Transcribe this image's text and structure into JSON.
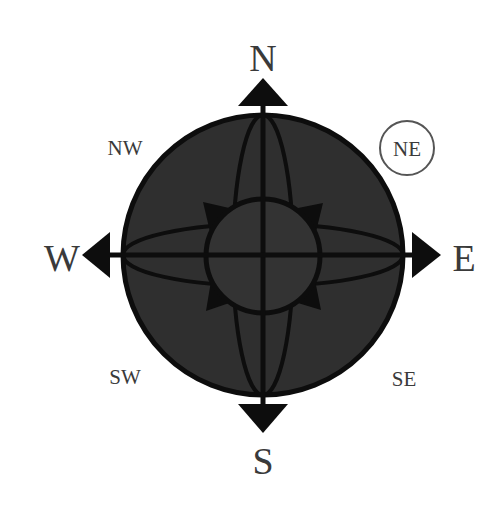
{
  "diagram": {
    "cardinals": {
      "north": "N",
      "east": "E",
      "south": "S",
      "west": "W"
    },
    "intercardinals": {
      "northwest": "NW",
      "northeast": "NE",
      "southwest": "SW",
      "southeast": "SE"
    },
    "highlighted": "NE",
    "colors": {
      "fill": "#2f2f2f",
      "stroke": "#0d0d0d",
      "text": "#3a3a3a",
      "highlight_ring": "#555555",
      "background": "#ffffff"
    }
  }
}
